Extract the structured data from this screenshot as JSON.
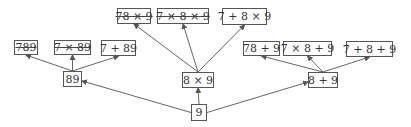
{
  "diagram": {
    "type": "tree",
    "root": "9",
    "nodes": [
      {
        "id": "n9",
        "label": "9",
        "struck": false,
        "x": 191,
        "y": 104,
        "w": 16,
        "h": 17
      },
      {
        "id": "n89",
        "label": "89",
        "struck": false,
        "x": 63,
        "y": 71,
        "w": 19,
        "h": 16
      },
      {
        "id": "n8x9",
        "label": "8 × 9",
        "struck": false,
        "x": 182,
        "y": 72,
        "w": 32,
        "h": 16
      },
      {
        "id": "n8p9",
        "label": "8 + 9",
        "struck": false,
        "x": 308,
        "y": 72,
        "w": 30,
        "h": 16
      },
      {
        "id": "n789",
        "label": "789",
        "struck": true,
        "x": 14,
        "y": 40,
        "w": 24,
        "h": 15
      },
      {
        "id": "n7x89",
        "label": "7 × 89",
        "struck": true,
        "x": 54,
        "y": 40,
        "w": 37,
        "h": 15
      },
      {
        "id": "n7p89",
        "label": "7 + 89",
        "struck": false,
        "x": 101,
        "y": 40,
        "w": 35,
        "h": 16
      },
      {
        "id": "n78x9",
        "label": "78 × 9",
        "struck": true,
        "x": 117,
        "y": 8,
        "w": 34,
        "h": 16
      },
      {
        "id": "n7x8x9",
        "label": "7 × 8 × 9",
        "struck": true,
        "x": 157,
        "y": 8,
        "w": 52,
        "h": 16
      },
      {
        "id": "n7p8x9",
        "label": "7 + 8 × 9",
        "struck": false,
        "x": 222,
        "y": 8,
        "w": 45,
        "h": 17
      },
      {
        "id": "n78p9",
        "label": "78 + 9",
        "struck": false,
        "x": 243,
        "y": 41,
        "w": 37,
        "h": 15
      },
      {
        "id": "n7x8p9",
        "label": "7 × 8 + 9",
        "struck": false,
        "x": 283,
        "y": 41,
        "w": 49,
        "h": 15
      },
      {
        "id": "n7p8p9",
        "label": "7 + 8 + 9",
        "struck": false,
        "x": 346,
        "y": 41,
        "w": 47,
        "h": 16
      }
    ],
    "edges": [
      {
        "from": "n9",
        "to": "n89"
      },
      {
        "from": "n9",
        "to": "n8x9"
      },
      {
        "from": "n9",
        "to": "n8p9"
      },
      {
        "from": "n89",
        "to": "n789"
      },
      {
        "from": "n89",
        "to": "n7x89"
      },
      {
        "from": "n89",
        "to": "n7p89"
      },
      {
        "from": "n8x9",
        "to": "n78x9"
      },
      {
        "from": "n8x9",
        "to": "n7x8x9"
      },
      {
        "from": "n8x9",
        "to": "n7p8x9"
      },
      {
        "from": "n8p9",
        "to": "n78p9"
      },
      {
        "from": "n8p9",
        "to": "n7x8p9"
      },
      {
        "from": "n8p9",
        "to": "n7p8p9"
      }
    ],
    "colors": {
      "edge": "#555555",
      "border": "#555555",
      "text": "#333333",
      "background": "#ffffff"
    }
  },
  "labels": {
    "n9": "9",
    "n89": "89",
    "n8x9": "8 × 9",
    "n8p9": "8 + 9",
    "n789": "789",
    "n7x89": "7 × 89",
    "n7p89": "7 + 89",
    "n78x9": "78 × 9",
    "n7x8x9": "7 × 8 × 9",
    "n7p8x9": "7 + 8 × 9",
    "n78p9": "78 + 9",
    "n7x8p9": "7 × 8 + 9",
    "n7p8p9": "7 + 8 + 9"
  }
}
